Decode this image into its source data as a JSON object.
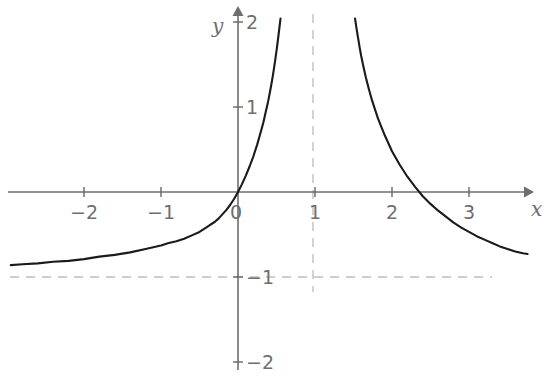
{
  "chart_data": {
    "type": "line",
    "title": "",
    "xlabel": "x",
    "ylabel": "y",
    "xlim": [
      -2.95,
      3.75
    ],
    "ylim": [
      -2.1,
      2.1
    ],
    "grid": false,
    "legend": null,
    "x_ticks": [
      {
        "value": -2,
        "label": "−2"
      },
      {
        "value": -1,
        "label": "−1"
      },
      {
        "value": 0,
        "label": "0"
      },
      {
        "value": 1,
        "label": "1"
      },
      {
        "value": 2,
        "label": "2"
      },
      {
        "value": 3,
        "label": "3"
      }
    ],
    "y_ticks": [
      {
        "value": 2,
        "label": "2"
      },
      {
        "value": 1,
        "label": "1"
      },
      {
        "value": -1,
        "label": "−1"
      },
      {
        "value": -2,
        "label": "−2"
      }
    ],
    "asymptotes": [
      {
        "orientation": "vertical",
        "value": 1,
        "style": "dashed"
      },
      {
        "orientation": "horizontal",
        "value": -1,
        "style": "dashed"
      }
    ],
    "intercepts": [
      {
        "x": 0,
        "y": 0
      },
      {
        "x": 2,
        "y": 0
      }
    ],
    "series": [
      {
        "name": "left-branch",
        "comment": "x from -2.95 to just left of 1, rising from y=-1 asymptote through origin up to y=2",
        "points": [
          [
            -2.95,
            -0.86
          ],
          [
            -2.8,
            -0.85
          ],
          [
            -2.6,
            -0.84
          ],
          [
            -2.4,
            -0.82
          ],
          [
            -2.2,
            -0.81
          ],
          [
            -2.0,
            -0.79
          ],
          [
            -1.8,
            -0.76
          ],
          [
            -1.6,
            -0.74
          ],
          [
            -1.4,
            -0.71
          ],
          [
            -1.2,
            -0.67
          ],
          [
            -1.0,
            -0.63
          ],
          [
            -0.9,
            -0.6
          ],
          [
            -0.8,
            -0.58
          ],
          [
            -0.7,
            -0.55
          ],
          [
            -0.6,
            -0.51
          ],
          [
            -0.5,
            -0.47
          ],
          [
            -0.4,
            -0.41
          ],
          [
            -0.3,
            -0.35
          ],
          [
            -0.25,
            -0.31
          ],
          [
            -0.2,
            -0.26
          ],
          [
            -0.15,
            -0.21
          ],
          [
            -0.1,
            -0.15
          ],
          [
            -0.05,
            -0.08
          ],
          [
            0.0,
            0.0
          ],
          [
            0.05,
            0.09
          ],
          [
            0.1,
            0.19
          ],
          [
            0.15,
            0.3
          ],
          [
            0.2,
            0.42
          ],
          [
            0.25,
            0.56
          ],
          [
            0.3,
            0.72
          ],
          [
            0.33,
            0.82
          ],
          [
            0.36,
            0.94
          ],
          [
            0.39,
            1.06
          ],
          [
            0.42,
            1.2
          ],
          [
            0.44,
            1.3
          ],
          [
            0.46,
            1.41
          ],
          [
            0.48,
            1.53
          ],
          [
            0.5,
            1.66
          ],
          [
            0.52,
            1.8
          ],
          [
            0.54,
            1.95
          ],
          [
            0.552,
            2.04
          ]
        ]
      },
      {
        "name": "right-branch",
        "comment": "x from just right of 1 down through root at x=2 toward y=-1 asymptote",
        "points": [
          [
            1.52,
            2.04
          ],
          [
            1.54,
            1.92
          ],
          [
            1.56,
            1.81
          ],
          [
            1.58,
            1.7
          ],
          [
            1.6,
            1.6
          ],
          [
            1.63,
            1.47
          ],
          [
            1.66,
            1.35
          ],
          [
            1.7,
            1.21
          ],
          [
            1.74,
            1.08
          ],
          [
            1.78,
            0.97
          ],
          [
            1.82,
            0.86
          ],
          [
            1.86,
            0.77
          ],
          [
            1.9,
            0.68
          ],
          [
            1.95,
            0.58
          ],
          [
            2.0,
            0.48
          ],
          [
            2.05,
            0.4
          ],
          [
            2.1,
            0.32
          ],
          [
            2.15,
            0.25
          ],
          [
            2.2,
            0.18
          ],
          [
            2.3,
            0.06
          ],
          [
            2.4,
            -0.05
          ],
          [
            2.5,
            -0.14
          ],
          [
            2.6,
            -0.22
          ],
          [
            2.7,
            -0.29
          ],
          [
            2.8,
            -0.36
          ],
          [
            2.9,
            -0.42
          ],
          [
            3.0,
            -0.47
          ],
          [
            3.1,
            -0.52
          ],
          [
            3.2,
            -0.56
          ],
          [
            3.3,
            -0.6
          ],
          [
            3.4,
            -0.64
          ],
          [
            3.5,
            -0.67
          ],
          [
            3.6,
            -0.7
          ],
          [
            3.7,
            -0.72
          ],
          [
            3.76,
            -0.73
          ]
        ]
      }
    ],
    "colors": {
      "curve": "#1a1a1a",
      "axis": "#666666",
      "tick_label": "#6e6e6e",
      "dashed": "#c0c0c0",
      "background": "#ffffff"
    }
  },
  "axes": {
    "x_name": "x",
    "y_name": "y"
  }
}
